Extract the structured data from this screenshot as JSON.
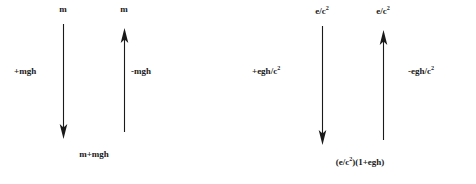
{
  "diagram": {
    "background_color": "#ffffff",
    "ink_color": "#1a1a1a",
    "panels": [
      {
        "id": "left-panel",
        "name": "mass-panel",
        "arrows": [
          {
            "id": "left-down-arrow",
            "direction": "down",
            "top_label": "m",
            "side_label": "+mgh",
            "side_label_position": "left",
            "bottom_label": "m+mgh"
          },
          {
            "id": "left-up-arrow",
            "direction": "up",
            "top_label": "m",
            "side_label": "-mgh",
            "side_label_position": "right",
            "bottom_label": ""
          }
        ]
      },
      {
        "id": "right-panel",
        "name": "energy-panel",
        "arrows": [
          {
            "id": "right-down-arrow",
            "direction": "down",
            "top_label_base": "e/c",
            "top_label_sup": "2",
            "side_label_base": "+egh/c",
            "side_label_sup": "2",
            "side_label_position": "left",
            "bottom_label_part1": "(e/c",
            "bottom_label_sup": "2",
            "bottom_label_part2": ")(1+egh)"
          },
          {
            "id": "right-up-arrow",
            "direction": "up",
            "top_label_base": "e/c",
            "top_label_sup": "2",
            "side_label_base": "-egh/c",
            "side_label_sup": "2",
            "side_label_position": "right"
          }
        ]
      }
    ]
  }
}
